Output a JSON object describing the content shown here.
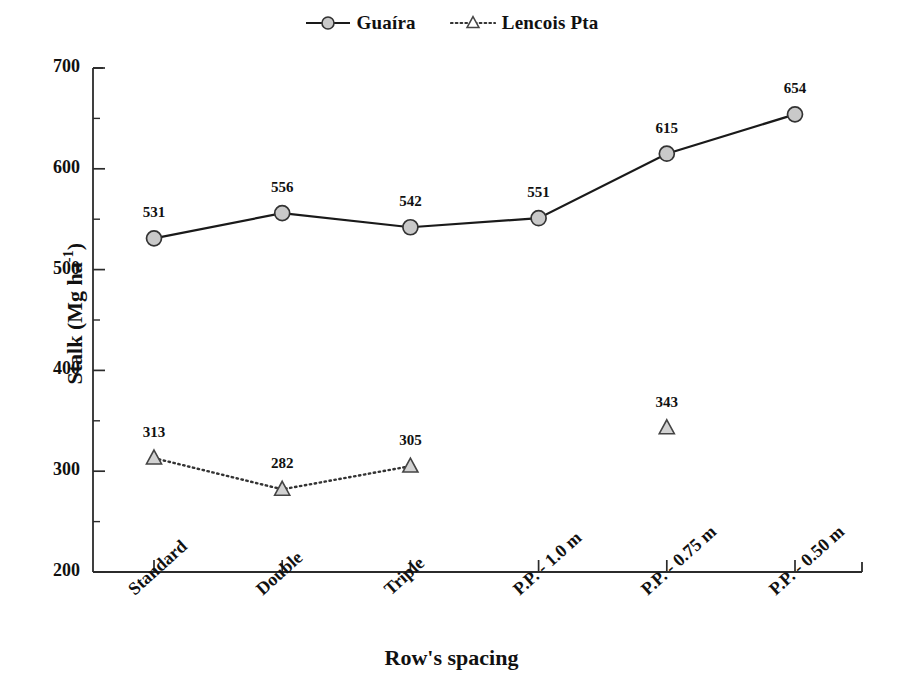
{
  "chart_data": {
    "type": "line",
    "title": "",
    "xlabel": "Row's spacing",
    "ylabel": "Stalk (Mg ha-1)",
    "ylabel_base": "Stalk (Mg ha",
    "ylabel_sup": "-1",
    "ylabel_close": ")",
    "categories": [
      "Standard",
      "Double",
      "Triple",
      "P.P. - 1.0 m",
      "P.P. - 0.75 m",
      "P.P. - 0.50 m"
    ],
    "ylim": [
      200,
      700
    ],
    "y_major_ticks": [
      200,
      300,
      400,
      500,
      600,
      700
    ],
    "y_minor_ticks": [
      250,
      350,
      450,
      550,
      650
    ],
    "y_tick_labels": [
      "200",
      "300",
      "400",
      "500",
      "600",
      "700"
    ],
    "grid": false,
    "legend_position": "top-center",
    "series": [
      {
        "name": "Guaíra",
        "marker": "circle",
        "marker_fill": "#c9c9c9",
        "marker_stroke": "#333333",
        "line_style": "solid",
        "line_color": "#1a1a1a",
        "values": [
          531,
          556,
          542,
          551,
          615,
          654
        ],
        "labels": [
          "531",
          "556",
          "542",
          "551",
          "615",
          "654"
        ]
      },
      {
        "name": "Lencois Pta",
        "marker": "triangle",
        "marker_fill": "#d2d2d2",
        "marker_stroke": "#444444",
        "line_style": "dotted",
        "line_color": "#333333",
        "values": [
          313,
          282,
          305,
          null,
          343,
          null
        ],
        "labels": [
          "313",
          "282",
          "305",
          "",
          "343",
          ""
        ]
      }
    ]
  },
  "legend": {
    "items": [
      {
        "label": "Guaíra",
        "icon": "line-circle-marker"
      },
      {
        "label": "Lencois Pta",
        "icon": "dotted-line-triangle-marker"
      }
    ]
  },
  "axes": {
    "x_title": "Row's spacing",
    "y_title_base": "Stalk (Mg ha",
    "y_title_sup": "-1",
    "y_title_close": ")"
  },
  "colors": {
    "axis": "#2b2b2b",
    "text": "#111111",
    "series_guaira_line": "#1a1a1a",
    "series_guaira_marker": "#c9c9c9",
    "series_lencois_line": "#333333",
    "series_lencois_marker": "#d2d2d2",
    "background": "#ffffff"
  }
}
